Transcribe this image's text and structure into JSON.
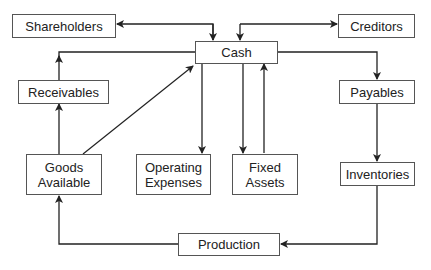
{
  "diagram": {
    "nodes": {
      "shareholders": "Shareholders",
      "cash": "Cash",
      "creditors": "Creditors",
      "receivables": "Receivables",
      "payables": "Payables",
      "goods_available": "Goods\nAvailable",
      "operating_expenses": "Operating\nExpenses",
      "fixed_assets": "Fixed\nAssets",
      "inventories": "Inventories",
      "production": "Production"
    },
    "edges": [
      {
        "from": "Shareholders",
        "to": "Cash",
        "bidirectional": true
      },
      {
        "from": "Cash",
        "to": "Creditors",
        "bidirectional": true
      },
      {
        "from": "Cash",
        "to": "Payables"
      },
      {
        "from": "Payables",
        "to": "Inventories"
      },
      {
        "from": "Inventories",
        "to": "Production"
      },
      {
        "from": "Production",
        "to": "Goods Available"
      },
      {
        "from": "Goods Available",
        "to": "Receivables"
      },
      {
        "from": "Receivables",
        "to": "Cash"
      },
      {
        "from": "Goods Available",
        "to": "Cash"
      },
      {
        "from": "Cash",
        "to": "Operating Expenses"
      },
      {
        "from": "Cash",
        "to": "Fixed Assets"
      },
      {
        "from": "Fixed Assets",
        "to": "Cash"
      }
    ],
    "colors": {
      "line": "#222222",
      "border": "#555555",
      "text": "#222222"
    }
  }
}
